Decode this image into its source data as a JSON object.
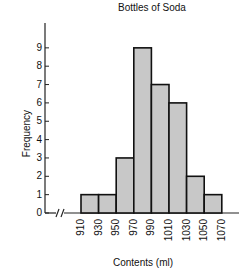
{
  "chart_data": {
    "type": "bar",
    "title": "Bottles of Soda",
    "xlabel": "Contents (ml)",
    "ylabel": "Frequency",
    "categories": [
      "910-930",
      "930-950",
      "950-970",
      "970-990",
      "990-1010",
      "1010-1030",
      "1030-1050",
      "1050-1070"
    ],
    "bin_edges": [
      910,
      930,
      950,
      970,
      990,
      1010,
      1030,
      1050,
      1070
    ],
    "values": [
      1,
      1,
      3,
      9,
      7,
      6,
      2,
      1
    ],
    "ylim": [
      0,
      10
    ],
    "yticks": [
      "0",
      "1",
      "2",
      "3",
      "4",
      "5",
      "6",
      "7",
      "8",
      "9"
    ],
    "xticks": [
      "910",
      "930",
      "950",
      "970",
      "990",
      "1010",
      "1030",
      "1050",
      "1070"
    ],
    "axis_break": true,
    "bar_color": "#c8c8c8",
    "grid": false
  }
}
